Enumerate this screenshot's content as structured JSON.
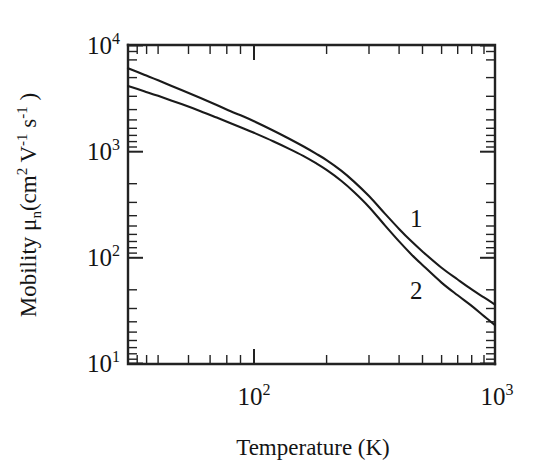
{
  "figure": {
    "background_color": "#ffffff",
    "line_color": "#1a1a1a"
  },
  "chart_data": {
    "type": "line",
    "title": "",
    "subtitle": "",
    "xlabel": "Temperature (K)",
    "ylabel": "Mobility μ_n (cm^2 V^-1 s^-1)",
    "xscale": "log",
    "yscale": "log",
    "xlim": [
      30,
      1000
    ],
    "ylim": [
      10,
      10000
    ],
    "grid": false,
    "legend_position": "inline-annotation",
    "xticklabels": [
      "10²",
      "10³"
    ],
    "xtickvalues": [
      100,
      1000
    ],
    "yticklabels": [
      "10¹",
      "10²",
      "10³",
      "10⁴"
    ],
    "ytickvalues": [
      10,
      100,
      1000,
      10000
    ],
    "x_minor_ticks": [
      30,
      40,
      50,
      60,
      70,
      80,
      90,
      200,
      300,
      400,
      500,
      600,
      700,
      800,
      900
    ],
    "y_minor_ticks": [
      20,
      30,
      40,
      50,
      60,
      70,
      80,
      90,
      200,
      300,
      400,
      500,
      600,
      700,
      800,
      900,
      2000,
      3000,
      4000,
      5000,
      6000,
      7000,
      8000,
      9000
    ],
    "annotations": [
      {
        "text": "1",
        "x": 330,
        "y": 230
      },
      {
        "text": "2",
        "x": 330,
        "y": 78
      }
    ],
    "series": [
      {
        "name": "1",
        "label": "1",
        "x": [
          30,
          35,
          40,
          50,
          60,
          70,
          80,
          90,
          100,
          120,
          140,
          160,
          180,
          200,
          230,
          260,
          300,
          350,
          400,
          450,
          500,
          600,
          700,
          800,
          900,
          1000
        ],
        "y": [
          6100,
          5300,
          4700,
          3800,
          3200,
          2750,
          2400,
          2150,
          1930,
          1580,
          1320,
          1120,
          960,
          830,
          660,
          520,
          380,
          258,
          186,
          142,
          114,
          80,
          62,
          50,
          42,
          36
        ]
      },
      {
        "name": "2",
        "label": "2",
        "x": [
          30,
          35,
          40,
          50,
          60,
          70,
          80,
          90,
          100,
          120,
          140,
          160,
          180,
          200,
          230,
          260,
          300,
          350,
          400,
          450,
          500,
          600,
          700,
          800,
          900,
          1000
        ],
        "y": [
          4150,
          3700,
          3350,
          2800,
          2400,
          2090,
          1850,
          1660,
          1500,
          1250,
          1060,
          910,
          780,
          670,
          530,
          415,
          300,
          200,
          142,
          107,
          85,
          58,
          44,
          35,
          28,
          23
        ]
      }
    ]
  },
  "axis_titles": {
    "y_prefix": "Mobility ",
    "y_mu": "μ",
    "y_mu_sub": "n",
    "y_open": "(cm",
    "y_sup2": "2",
    "y_v": " V",
    "y_vsup": "-1",
    "y_s": " s",
    "y_ssup": "-1",
    "y_close": " )",
    "x_title": "Temperature (K)"
  },
  "tick_labels": {
    "y": [
      {
        "base": "10",
        "exp": "4"
      },
      {
        "base": "10",
        "exp": "3"
      },
      {
        "base": "10",
        "exp": "2"
      },
      {
        "base": "10",
        "exp": "1"
      }
    ],
    "x": [
      {
        "base": "10",
        "exp": "2"
      },
      {
        "base": "10",
        "exp": "3"
      }
    ]
  },
  "curve_labels": {
    "one": "1",
    "two": "2"
  }
}
